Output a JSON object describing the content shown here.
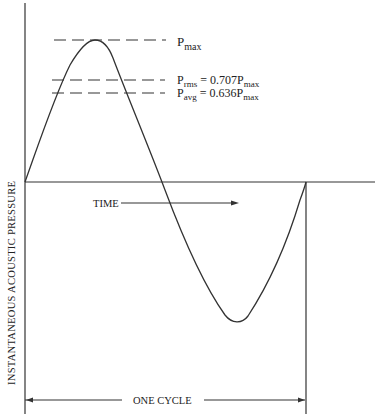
{
  "diagram": {
    "y_axis_label": "INSTANTANEOUS ACOUSTIC PRESSURE",
    "time_label": "TIME",
    "cycle_label": "ONE CYCLE",
    "levels": [
      {
        "id": "pmax",
        "P": "P",
        "sub": "max",
        "rest": ""
      },
      {
        "id": "prms",
        "P": "P",
        "sub": "rms",
        "rest": " = 0.707P",
        "sub2": "max"
      },
      {
        "id": "pavg",
        "P": "P",
        "sub": "avg",
        "rest": " = 0.636P",
        "sub2": "max"
      }
    ],
    "colors": {
      "line": "#222222",
      "background": "#ffffff"
    }
  }
}
